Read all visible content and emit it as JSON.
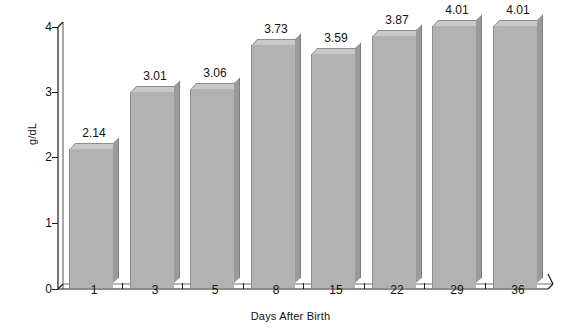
{
  "chart_data": {
    "type": "bar",
    "title": "",
    "subtitle": "",
    "xlabel": "Days After Birth",
    "ylabel": "g/dL",
    "categories": [
      "1",
      "3",
      "5",
      "8",
      "15",
      "22",
      "29",
      "36"
    ],
    "values": [
      2.14,
      3.01,
      3.06,
      3.73,
      3.59,
      3.87,
      4.01,
      4.01
    ],
    "value_labels": [
      "2.14",
      "3.01",
      "3.06",
      "3.73",
      "3.59",
      "3.87",
      "4.01",
      "4.01"
    ],
    "ylim": [
      0,
      4
    ],
    "y_ticks": [
      "0",
      "1",
      "2",
      "3",
      "4"
    ],
    "y_tick_values": [
      0,
      1,
      2,
      3,
      4
    ],
    "grid": false,
    "legend": null,
    "style": "3d-bar",
    "colors": {
      "bar_front": "#b2b2b2",
      "bar_top": "#c9c9c9",
      "bar_side": "#9a9a9a",
      "axis": "#1a1a1a",
      "text": "#111111",
      "background": "#ffffff"
    }
  }
}
